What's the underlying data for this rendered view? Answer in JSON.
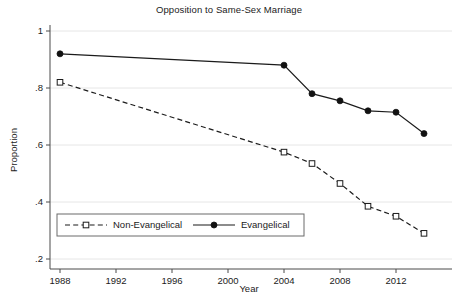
{
  "chart_data": {
    "type": "line",
    "title": "Opposition to Same-Sex Marriage",
    "xlabel": "Year",
    "ylabel": "Proportion",
    "xlim": [
      1987,
      2015
    ],
    "ylim": [
      0.2,
      1.0
    ],
    "grid": true,
    "legend_position": "inside-bottom-left",
    "x_ticks": [
      1988,
      1992,
      1996,
      2000,
      2004,
      2008,
      2012
    ],
    "x_tick_labels": [
      "1988",
      "1992",
      "1996",
      "2000",
      "2004",
      "2008",
      "2012"
    ],
    "y_ticks": [
      0.2,
      0.4,
      0.6,
      0.8,
      1.0
    ],
    "y_tick_labels": [
      ".2",
      ".4",
      ".6",
      ".8",
      "1"
    ],
    "series": [
      {
        "name": "Non-Evangelical",
        "marker": "open-square",
        "line_style": "dashed",
        "x": [
          1988,
          2004,
          2006,
          2008,
          2010,
          2012,
          2014
        ],
        "values": [
          0.82,
          0.575,
          0.535,
          0.465,
          0.385,
          0.35,
          0.29
        ]
      },
      {
        "name": "Evangelical",
        "marker": "filled-circle",
        "line_style": "solid",
        "x": [
          1988,
          2004,
          2006,
          2008,
          2010,
          2012,
          2014
        ],
        "values": [
          0.92,
          0.88,
          0.78,
          0.755,
          0.72,
          0.715,
          0.64
        ]
      }
    ]
  },
  "legend": {
    "entries": [
      {
        "label": "Non-Evangelical"
      },
      {
        "label": "Evangelical"
      }
    ]
  },
  "colors": {
    "line": "#1b1b1b",
    "grid": "#e6e6e6",
    "axis": "#4a4a4a",
    "text": "#1b1b1b",
    "background": "#ffffff"
  }
}
